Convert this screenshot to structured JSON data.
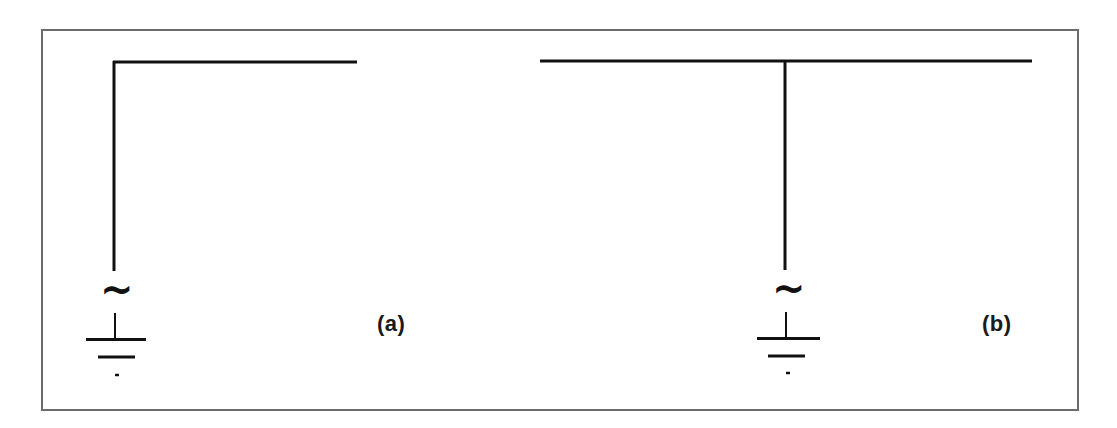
{
  "figure": {
    "type": "antenna-configurations",
    "panels": [
      {
        "id": "a",
        "label": "(a)",
        "description": "Inverted-L antenna fed at base by AC source to ground",
        "source_symbol": "~",
        "ground_symbol": "ground"
      },
      {
        "id": "b",
        "label": "(b)",
        "description": "T antenna fed at center by AC source to ground",
        "source_symbol": "~",
        "ground_symbol": "ground"
      }
    ],
    "colors": {
      "line": "#111111",
      "frame": "#6b6b6b",
      "background": "#ffffff"
    }
  }
}
